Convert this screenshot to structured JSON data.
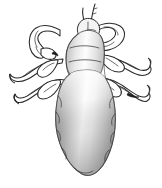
{
  "image": {
    "title": "Louse dorsal view line illustration",
    "subject": "louse",
    "subject_common_name": "Head louse",
    "view": "dorsal",
    "style": "black and white line drawing with grayscale gradient shading",
    "alt_text": "Black and white scientific illustration of a louse seen from above, with a small head bearing antennae at the top, three pairs of clawed legs, and a large gradient-shaded lobed abdomen.",
    "width_px": 162,
    "height_px": 188
  },
  "colors": {
    "background": "#ffffff",
    "outline": "#2b2b2b",
    "outline_light": "#3a3a3a",
    "claw": "#1c1c1c",
    "abdomen_shadow": "#6e6e6e",
    "abdomen_mid": "#bfbfbf",
    "abdomen_highlight": "#fbfbfb",
    "limb_fill": "#ffffff",
    "head_fill": "#f4f4f4"
  },
  "anatomy": {
    "parts": [
      {
        "id": "antenna-left",
        "label": "Left antenna",
        "side": "left"
      },
      {
        "id": "antenna-right",
        "label": "Right antenna",
        "side": "right"
      },
      {
        "id": "head",
        "label": "Head",
        "side": "center"
      },
      {
        "id": "thorax",
        "label": "Thorax",
        "side": "center"
      },
      {
        "id": "abdomen",
        "label": "Abdomen",
        "side": "center"
      },
      {
        "id": "leg-front-left",
        "label": "Front left leg",
        "side": "left"
      },
      {
        "id": "leg-middle-left",
        "label": "Middle left leg",
        "side": "left"
      },
      {
        "id": "leg-hind-left",
        "label": "Hind left leg",
        "side": "left"
      },
      {
        "id": "leg-front-right",
        "label": "Front right leg",
        "side": "right"
      },
      {
        "id": "leg-middle-right",
        "label": "Middle right leg",
        "side": "right"
      },
      {
        "id": "leg-hind-right",
        "label": "Hind right leg",
        "side": "right"
      }
    ],
    "leg_pairs": 3,
    "claws": 6,
    "abdomen_lobes": 7
  }
}
